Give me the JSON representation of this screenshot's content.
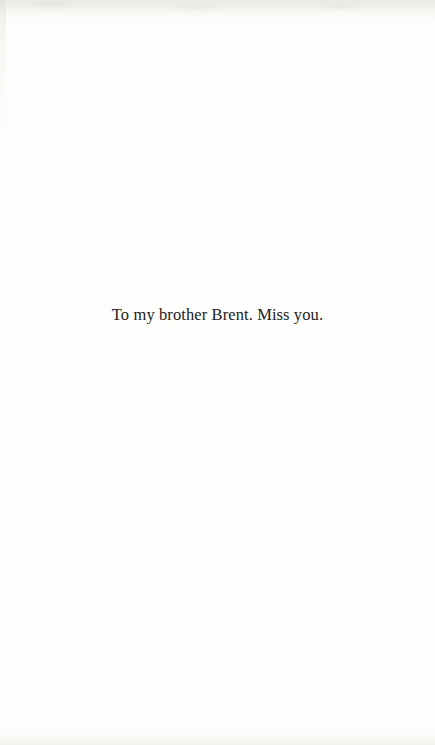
{
  "page": {
    "type": "book-dedication-page",
    "dedication_text": "To my brother Brent. Miss you.",
    "background_color": "#fdfdfb",
    "text_color": "#242220",
    "edge_shadow_color": "#e9e9e5"
  }
}
